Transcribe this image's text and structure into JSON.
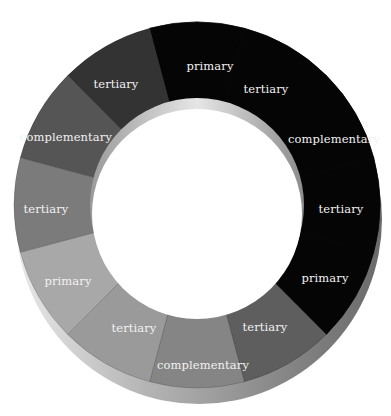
{
  "diagram": {
    "type": "color-wheel-ring",
    "center": [
      197,
      205
    ],
    "outer_radius": 183,
    "inner_radius": 106,
    "segments": [
      {
        "label": "primary",
        "start": 255,
        "end": 285,
        "color": "#050505",
        "label_pos": [
          210,
          66
        ]
      },
      {
        "label": "tertiary",
        "start": 285,
        "end": 315,
        "color": "#050505",
        "label_pos": [
          266,
          89
        ]
      },
      {
        "label": "complementary",
        "start": 315,
        "end": 345,
        "color": "#050505",
        "label_pos": [
          334,
          139
        ]
      },
      {
        "label": "tertiary",
        "start": 345,
        "end": 375,
        "color": "#050505",
        "label_pos": [
          341,
          209
        ]
      },
      {
        "label": "primary",
        "start": 15,
        "end": 45,
        "color": "#050505",
        "label_pos": [
          325,
          278
        ]
      },
      {
        "label": "tertiary",
        "start": 45,
        "end": 75,
        "color": "#5e5e5e",
        "label_pos": [
          265,
          327
        ]
      },
      {
        "label": "complementary",
        "start": 75,
        "end": 105,
        "color": "#858585",
        "label_pos": [
          203,
          365
        ]
      },
      {
        "label": "tertiary",
        "start": 105,
        "end": 135,
        "color": "#9a9a9a",
        "label_pos": [
          134,
          328
        ]
      },
      {
        "label": "primary",
        "start": 135,
        "end": 165,
        "color": "#a8a8a8",
        "label_pos": [
          68,
          281
        ]
      },
      {
        "label": "tertiary",
        "start": 165,
        "end": 195,
        "color": "#7b7b7b",
        "label_pos": [
          46,
          209
        ]
      },
      {
        "label": "complementary",
        "start": 195,
        "end": 225,
        "color": "#555555",
        "label_pos": [
          66,
          137
        ]
      },
      {
        "label": "tertiary",
        "start": 225,
        "end": 255,
        "color": "#333333",
        "label_pos": [
          116,
          84
        ]
      }
    ]
  }
}
